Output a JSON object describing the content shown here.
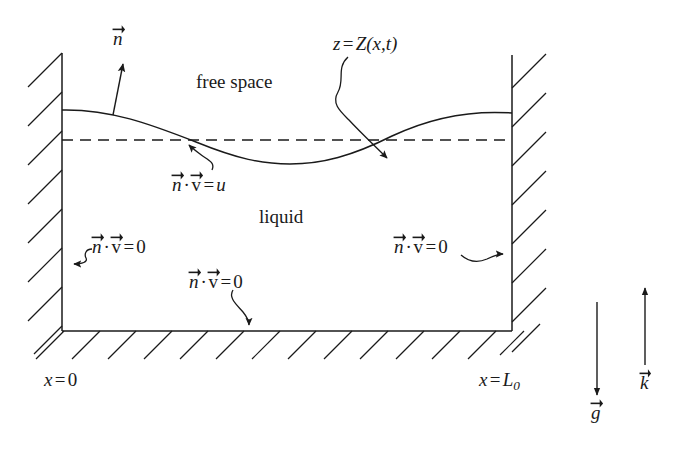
{
  "figure": {
    "kind": "physics-schematic",
    "background_color": "#ffffff",
    "ink_color": "#1a1a1a"
  },
  "regions": {
    "free_space_label": "free space",
    "liquid_label": "liquid"
  },
  "surface": {
    "elevation_label_z": "z",
    "elevation_label_eq": "=",
    "elevation_label_Z": "Z",
    "elevation_label_args": "(x,t)",
    "normal_vector_label": "n",
    "kinematic_bc": {
      "n": "n",
      "dot": "·",
      "v": "v",
      "eq": "=",
      "rhs": "u"
    }
  },
  "boundary_conditions": {
    "left_wall": {
      "n": "n",
      "dot": "·",
      "v": "v",
      "eq": "=",
      "rhs": "0"
    },
    "right_wall": {
      "n": "n",
      "dot": "·",
      "v": "v",
      "eq": "=",
      "rhs": "0"
    },
    "bottom_wall": {
      "n": "n",
      "dot": "·",
      "v": "v",
      "eq": "=",
      "rhs": "0"
    }
  },
  "axis_labels": {
    "left_x": "x",
    "left_eq": "=",
    "left_value": "0",
    "right_x": "x",
    "right_eq": "=",
    "right_value": "L",
    "right_subscript": "0"
  },
  "vectors": {
    "gravity_label": "g",
    "unit_up_label": "k"
  },
  "geometry": {
    "left_wall_x": 62,
    "right_wall_x": 512,
    "wall_top_y": 53,
    "bottom_y": 331,
    "mean_level_y": 140,
    "wave_left_y": 110,
    "wave_trough_y": 164,
    "wave_trough_x": 290,
    "wave_right_y": 113
  }
}
